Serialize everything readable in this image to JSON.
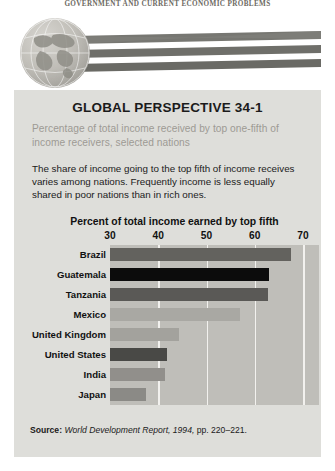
{
  "running_head": "GOVERNMENT AND CURRENT ECONOMIC PROBLEMS",
  "panel": {
    "title": "GLOBAL PERSPECTIVE 34-1",
    "subtitle": "Percentage of total income received by top one-fifth of income receivers, selected nations",
    "body": "The share of income going to the top fifth of income receives varies among nations. Frequently income is less equally shared in poor nations than in rich ones."
  },
  "source": {
    "label": "Source:",
    "citation": "World Development Report, 1994,",
    "pages": "pp. 220–221."
  },
  "colors": {
    "panel_bg": "#dededa",
    "plot_bg": "#bfbeb9",
    "gridline": "#f2f1ee",
    "page_bg": "#ffffff",
    "subtitle": "#9d9a94",
    "text": "#1b1b1b"
  },
  "chart_data": {
    "type": "bar",
    "orientation": "horizontal",
    "title": "Percent of total income earned by top fifth",
    "xlabel": "",
    "ylabel": "",
    "xlim": [
      30,
      70
    ],
    "ticks": [
      30,
      40,
      50,
      60,
      70
    ],
    "grid": true,
    "legend": "none",
    "categories": [
      "Brazil",
      "Guatemala",
      "Tanzania",
      "Mexico",
      "United Kingdom",
      "United States",
      "India",
      "Japan"
    ],
    "values": [
      67.5,
      63.0,
      62.7,
      57.0,
      44.3,
      41.9,
      41.4,
      37.5
    ],
    "bar_colors": [
      "#63625e",
      "#0c0c0c",
      "#5a5956",
      "#a9a8a3",
      "#a3a29d",
      "#494946",
      "#918f8b",
      "#8b8a86"
    ]
  }
}
